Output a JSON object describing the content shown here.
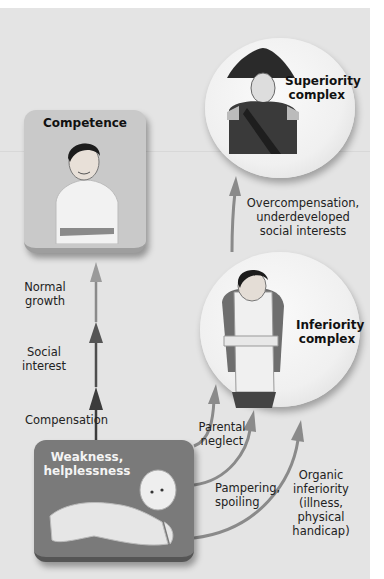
{
  "diagram": {
    "nodes": {
      "competence": {
        "label": "Competence"
      },
      "superiority": {
        "label_line1": "Superiority",
        "label_line2": "complex"
      },
      "inferiority": {
        "label_line1": "Inferiority",
        "label_line2": "complex"
      },
      "weakness": {
        "label_line1": "Weakness,",
        "label_line2": "helplessness"
      }
    },
    "edges": {
      "compensation": {
        "label": "Compensation"
      },
      "social_interest": {
        "label_line1": "Social",
        "label_line2": "interest"
      },
      "normal_growth": {
        "label_line1": "Normal",
        "label_line2": "growth"
      },
      "overcompensation": {
        "line1": "Overcompensation,",
        "line2": "underdeveloped",
        "line3": "social interests"
      },
      "parental_neglect": {
        "line1": "Parental",
        "line2": "neglect"
      },
      "pampering": {
        "line1": "Pampering,",
        "line2": "spoiling"
      },
      "organic_inferiority": {
        "line1": "Organic",
        "line2": "inferiority",
        "line3": "(illness,",
        "line4": "physical handicap)"
      }
    },
    "colors": {
      "panel_bg": "#e4e4e4",
      "competence_box": "#c9c9c9",
      "weakness_box": "#7a7a7a",
      "arrow_dark": "#444444",
      "arrow_mid": "#6a6a6a",
      "arrow_light": "#9a9a9a"
    }
  }
}
